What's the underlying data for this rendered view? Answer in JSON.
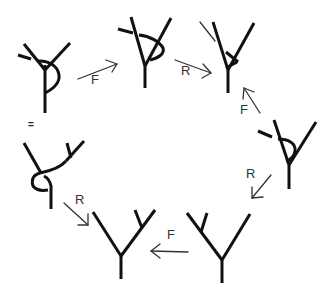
{
  "colors": {
    "stroke": "#111111",
    "arrow": "#333333",
    "background": "#ffffff"
  },
  "equals_sign": {
    "text": "=",
    "x": 32,
    "y": 122
  },
  "moves": [
    {
      "id": "move-1",
      "label": "F",
      "label_x": 97,
      "label_y": 79,
      "arrow": {
        "x1": 78,
        "y1": 79,
        "x2": 117,
        "y2": 64
      }
    },
    {
      "id": "move-2",
      "label": "R",
      "label_x": 185,
      "label_y": 67,
      "arrow": {
        "x1": 175,
        "y1": 60,
        "x2": 211,
        "y2": 73
      }
    },
    {
      "id": "move-3",
      "label": "F",
      "label_x": 243,
      "label_y": 104,
      "arrow": {
        "x1": 260,
        "y1": 113,
        "x2": 244,
        "y2": 88
      }
    },
    {
      "id": "move-4",
      "label": "R",
      "label_x": 249,
      "label_y": 171,
      "arrow": {
        "x1": 271,
        "y1": 175,
        "x2": 252,
        "y2": 198
      }
    },
    {
      "id": "move-5",
      "label": "F",
      "label_x": 169,
      "label_y": 226,
      "arrow": {
        "x1": 188,
        "y1": 252,
        "x2": 151,
        "y2": 251
      }
    },
    {
      "id": "move-6",
      "label": "R",
      "label_x": 76,
      "label_y": 193,
      "arrow": {
        "x1": 64,
        "y1": 203,
        "x2": 88,
        "y2": 225
      }
    }
  ],
  "trees": [
    {
      "id": "tree-1",
      "description": "trivalent vertex with twisted leftmost leg and crossing loop"
    },
    {
      "id": "tree-2",
      "description": "trivalent vertex with crossing arc over left leg"
    },
    {
      "id": "tree-3",
      "description": "trivalent vertex with short inner branch"
    },
    {
      "id": "tree-4",
      "description": "trivalent vertex with crossing loop under left leg"
    },
    {
      "id": "tree-5",
      "description": "binary tree, left branch split"
    },
    {
      "id": "tree-6",
      "description": "binary tree, right branch split"
    },
    {
      "id": "tree-7",
      "description": "twisted tree with loop near root"
    }
  ]
}
